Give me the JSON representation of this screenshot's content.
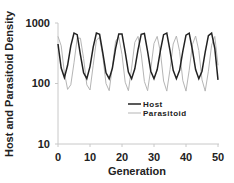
{
  "chart_data": {
    "type": "line",
    "title": "",
    "xlabel": "Generation",
    "ylabel": "Host and Parasitoid Density",
    "xlim": [
      0,
      50
    ],
    "ylim": [
      10,
      1000
    ],
    "yscale": "log",
    "xticks": [
      "0",
      "10",
      "20",
      "30",
      "40",
      "50"
    ],
    "yticks": [
      "10",
      "100",
      "1000"
    ],
    "grid": false,
    "legend_position": "lower right (inside)",
    "x": [
      0,
      1,
      2,
      3,
      4,
      5,
      6,
      7,
      8,
      9,
      10,
      11,
      12,
      13,
      14,
      15,
      16,
      17,
      18,
      19,
      20,
      21,
      22,
      23,
      24,
      25,
      26,
      27,
      28,
      29,
      30,
      31,
      32,
      33,
      34,
      35,
      36,
      37,
      38,
      39,
      40,
      41,
      42,
      43,
      44,
      45,
      46,
      47,
      48,
      49,
      50
    ],
    "series": [
      {
        "name": "Host",
        "color": "#222222",
        "values": [
          450,
          180,
          125,
          200,
          420,
          680,
          640,
          300,
          150,
          120,
          190,
          400,
          680,
          650,
          320,
          150,
          120,
          180,
          380,
          660,
          660,
          330,
          155,
          120,
          175,
          360,
          650,
          670,
          340,
          160,
          120,
          170,
          350,
          640,
          680,
          350,
          165,
          120,
          165,
          340,
          630,
          680,
          360,
          170,
          120,
          160,
          330,
          620,
          680,
          380,
          115
        ]
      },
      {
        "name": "Parasitoid",
        "color": "#b5b5b5",
        "values": [
          600,
          420,
          150,
          80,
          95,
          220,
          560,
          560,
          260,
          95,
          78,
          200,
          520,
          580,
          280,
          100,
          76,
          190,
          500,
          590,
          300,
          105,
          76,
          180,
          480,
          600,
          310,
          108,
          76,
          175,
          460,
          600,
          330,
          110,
          75,
          170,
          450,
          610,
          340,
          112,
          75,
          165,
          440,
          610,
          350,
          115,
          75,
          160,
          430,
          600,
          200
        ]
      }
    ]
  },
  "legend": {
    "items": [
      {
        "label": "Host",
        "color": "#222222"
      },
      {
        "label": "Parasitoid",
        "color": "#b5b5b5"
      }
    ]
  }
}
